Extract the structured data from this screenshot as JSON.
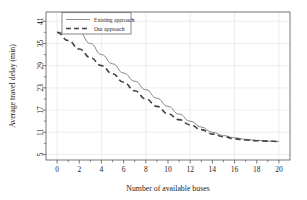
{
  "chart_data": {
    "type": "line",
    "title": "",
    "xlabel": "Number of available buses",
    "ylabel": "Average travel delay (min)",
    "xlim": [
      -1,
      21
    ],
    "ylim": [
      3.5,
      43.5
    ],
    "xticks": [
      0,
      2,
      4,
      6,
      8,
      10,
      12,
      14,
      16,
      18,
      20
    ],
    "xticklabels": [
      "0",
      "2",
      "4",
      "6",
      "8",
      "10",
      "12",
      "14",
      "16",
      "18",
      "20"
    ],
    "yticks": [
      5,
      11,
      17,
      23,
      29,
      35,
      41
    ],
    "yticklabels": [
      "5",
      "11",
      "17",
      "23",
      "29",
      "35",
      "41"
    ],
    "grid": true,
    "legend_position": "top-left",
    "x": [
      0,
      1,
      2,
      3,
      4,
      5,
      6,
      7,
      8,
      9,
      10,
      11,
      12,
      13,
      14,
      15,
      16,
      17,
      18,
      19,
      20
    ],
    "series": [
      {
        "name": "Existing approach",
        "style": "solid",
        "color": "#808080",
        "values": [
          38.0,
          38.0,
          38.0,
          35.0,
          32.0,
          29.5,
          27.0,
          24.8,
          22.5,
          20.2,
          18.0,
          15.9,
          14.0,
          12.4,
          11.0,
          10.1,
          9.5,
          9.1,
          8.8,
          8.6,
          8.5
        ]
      },
      {
        "name": "Our approach",
        "style": "dashed",
        "color": "#404040",
        "values": [
          38.0,
          35.8,
          33.5,
          31.2,
          29.0,
          26.8,
          24.5,
          22.2,
          20.0,
          18.0,
          16.0,
          14.4,
          13.0,
          11.7,
          10.5,
          9.8,
          9.2,
          8.9,
          8.7,
          8.6,
          8.5
        ]
      }
    ],
    "legend_entries": [
      "Existing approach",
      "Our approach"
    ]
  },
  "axes": {
    "ylabel_text": "Average travel delay (min)",
    "xlabel_text": "Number of available buses"
  },
  "colors": {
    "existing": "#808080",
    "ours": "#404040",
    "frame": "#555555",
    "grid": "#e2e2e2",
    "background": "#ffffff"
  }
}
